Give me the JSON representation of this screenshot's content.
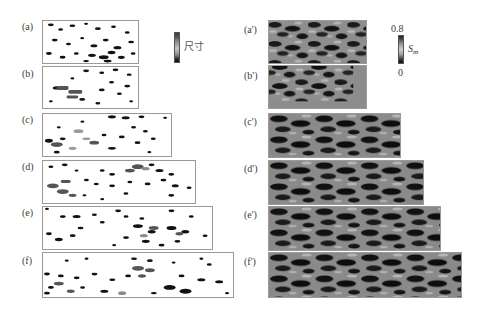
{
  "figure": {
    "left_column": {
      "description": "binary particle/defect maps colored by size",
      "panels": [
        {
          "id": "a",
          "label": "(a)"
        },
        {
          "id": "b",
          "label": "(b)"
        },
        {
          "id": "c",
          "label": "(c)"
        },
        {
          "id": "d",
          "label": "(d)"
        },
        {
          "id": "e",
          "label": "(e)"
        },
        {
          "id": "f",
          "label": "(f)"
        }
      ],
      "colorbar": {
        "label": "尺寸"
      }
    },
    "right_column": {
      "description": "grayscale Sm field maps",
      "panels": [
        {
          "id": "a_prime",
          "label": "(a')"
        },
        {
          "id": "b_prime",
          "label": "(b')"
        },
        {
          "id": "c_prime",
          "label": "(c')"
        },
        {
          "id": "d_prime",
          "label": "(d')"
        },
        {
          "id": "e_prime",
          "label": "(e')"
        },
        {
          "id": "f_prime",
          "label": "(f')"
        }
      ],
      "colorbar": {
        "symbol": "S",
        "subscript": "m",
        "max": "0.8",
        "min": "0"
      }
    }
  },
  "colors": {
    "background": "#ffffff",
    "panel_border": "#9a9a9a",
    "blob_dark": "#111111",
    "blob_mid": "#555555",
    "blob_light": "#8a8a8a",
    "field_base": "#8c8c8c",
    "field_light": "#b8b8b8"
  }
}
